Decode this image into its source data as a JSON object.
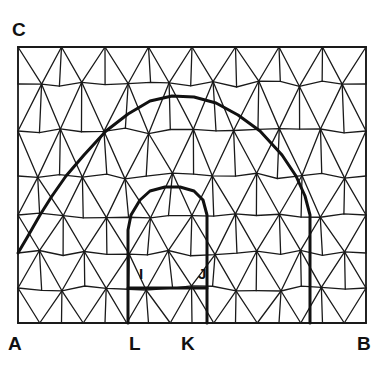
{
  "figure": {
    "type": "mesh-diagram",
    "background_color": "#ffffff",
    "line_color": "#1a1a1a",
    "thin_line_width": 1.3,
    "thick_line_width": 3.0,
    "domain_rect": {
      "x": 18,
      "y": 47,
      "width": 348,
      "height": 276
    }
  },
  "labels": {
    "corner_a": {
      "text": "A",
      "x": 8,
      "y": 334,
      "size": "outer"
    },
    "corner_b": {
      "text": "B",
      "x": 357,
      "y": 334,
      "size": "outer"
    },
    "corner_c": {
      "text": "C",
      "x": 12,
      "y": 20,
      "size": "outer"
    },
    "point_l": {
      "text": "L",
      "x": 129,
      "y": 334,
      "size": "outer"
    },
    "point_k": {
      "text": "K",
      "x": 181,
      "y": 334,
      "size": "outer"
    },
    "point_i": {
      "text": "I",
      "x": 139,
      "y": 266,
      "size": "inner"
    },
    "point_j": {
      "text": "J",
      "x": 198,
      "y": 266,
      "size": "inner"
    }
  },
  "chart_data": {
    "type": "mesh",
    "thin_edges": [
      [
        18,
        47,
        366,
        47
      ],
      [
        18,
        323,
        366,
        323
      ],
      [
        18,
        47,
        18,
        323
      ],
      [
        366,
        47,
        366,
        323
      ],
      [
        18,
        84,
        366,
        84
      ],
      [
        18,
        131,
        366,
        131
      ],
      [
        18,
        176,
        366,
        176
      ],
      [
        18,
        215,
        366,
        215
      ],
      [
        18,
        253,
        366,
        253
      ],
      [
        18,
        288,
        366,
        288
      ],
      [
        18,
        47,
        40,
        84
      ],
      [
        40,
        84,
        62,
        47
      ],
      [
        62,
        47,
        84,
        84
      ],
      [
        84,
        84,
        106,
        47
      ],
      [
        106,
        47,
        128,
        84
      ],
      [
        128,
        84,
        150,
        47
      ],
      [
        150,
        47,
        172,
        84
      ],
      [
        172,
        84,
        194,
        47
      ],
      [
        194,
        47,
        216,
        84
      ],
      [
        216,
        84,
        238,
        47
      ],
      [
        238,
        47,
        260,
        84
      ],
      [
        260,
        84,
        282,
        47
      ],
      [
        282,
        47,
        304,
        84
      ],
      [
        304,
        84,
        326,
        47
      ],
      [
        326,
        47,
        348,
        84
      ],
      [
        348,
        84,
        366,
        47
      ],
      [
        40,
        84,
        62,
        47
      ],
      [
        18,
        84,
        40,
        47
      ],
      [
        40,
        47,
        40,
        84
      ],
      [
        84,
        47,
        84,
        84
      ],
      [
        128,
        47,
        128,
        84
      ],
      [
        172,
        47,
        172,
        84
      ],
      [
        216,
        47,
        216,
        84
      ],
      [
        260,
        47,
        260,
        84
      ],
      [
        304,
        47,
        304,
        84
      ],
      [
        348,
        47,
        348,
        84
      ],
      [
        18,
        84,
        40,
        131
      ],
      [
        40,
        131,
        62,
        84
      ],
      [
        62,
        84,
        84,
        131
      ],
      [
        84,
        131,
        106,
        84
      ],
      [
        106,
        84,
        128,
        131
      ],
      [
        128,
        131,
        150,
        84
      ],
      [
        150,
        84,
        172,
        131
      ],
      [
        172,
        131,
        194,
        84
      ],
      [
        194,
        84,
        216,
        131
      ],
      [
        216,
        131,
        238,
        84
      ],
      [
        238,
        84,
        260,
        131
      ],
      [
        260,
        131,
        282,
        84
      ],
      [
        282,
        84,
        304,
        131
      ],
      [
        304,
        131,
        326,
        84
      ],
      [
        326,
        84,
        348,
        131
      ],
      [
        348,
        131,
        366,
        84
      ],
      [
        62,
        84,
        62,
        131
      ],
      [
        106,
        84,
        106,
        131
      ],
      [
        150,
        84,
        150,
        131
      ],
      [
        194,
        84,
        194,
        131
      ],
      [
        238,
        84,
        238,
        131
      ],
      [
        282,
        84,
        282,
        131
      ],
      [
        326,
        84,
        326,
        131
      ],
      [
        18,
        131,
        40,
        176
      ],
      [
        40,
        176,
        62,
        131
      ],
      [
        62,
        131,
        84,
        176
      ],
      [
        84,
        176,
        106,
        131
      ],
      [
        106,
        131,
        128,
        176
      ],
      [
        128,
        176,
        150,
        131
      ],
      [
        150,
        131,
        172,
        176
      ],
      [
        172,
        176,
        194,
        131
      ],
      [
        194,
        131,
        216,
        176
      ],
      [
        216,
        176,
        238,
        131
      ],
      [
        238,
        131,
        260,
        176
      ],
      [
        260,
        176,
        282,
        131
      ],
      [
        282,
        131,
        304,
        176
      ],
      [
        304,
        176,
        326,
        131
      ],
      [
        326,
        131,
        348,
        176
      ],
      [
        348,
        176,
        366,
        131
      ],
      [
        40,
        131,
        40,
        176
      ],
      [
        84,
        131,
        84,
        176
      ],
      [
        128,
        131,
        128,
        176
      ],
      [
        172,
        131,
        172,
        176
      ],
      [
        216,
        131,
        216,
        176
      ],
      [
        260,
        131,
        260,
        176
      ],
      [
        304,
        131,
        304,
        176
      ],
      [
        348,
        131,
        348,
        176
      ],
      [
        18,
        176,
        40,
        215
      ],
      [
        40,
        215,
        62,
        176
      ],
      [
        62,
        176,
        84,
        215
      ],
      [
        84,
        215,
        106,
        176
      ],
      [
        106,
        176,
        128,
        215
      ],
      [
        128,
        215,
        150,
        176
      ],
      [
        150,
        176,
        172,
        215
      ],
      [
        172,
        215,
        194,
        176
      ],
      [
        194,
        176,
        216,
        215
      ],
      [
        216,
        215,
        238,
        176
      ],
      [
        238,
        176,
        260,
        215
      ],
      [
        260,
        215,
        282,
        176
      ],
      [
        282,
        176,
        304,
        215
      ],
      [
        304,
        215,
        326,
        176
      ],
      [
        326,
        176,
        348,
        215
      ],
      [
        348,
        215,
        366,
        176
      ],
      [
        62,
        176,
        62,
        215
      ],
      [
        106,
        176,
        106,
        215
      ],
      [
        150,
        176,
        150,
        215
      ],
      [
        194,
        176,
        194,
        215
      ],
      [
        238,
        176,
        238,
        215
      ],
      [
        282,
        176,
        282,
        215
      ],
      [
        326,
        176,
        326,
        215
      ],
      [
        18,
        215,
        40,
        253
      ],
      [
        40,
        253,
        62,
        215
      ],
      [
        62,
        215,
        84,
        253
      ],
      [
        84,
        253,
        106,
        215
      ],
      [
        106,
        215,
        128,
        253
      ],
      [
        128,
        253,
        150,
        215
      ],
      [
        150,
        215,
        172,
        253
      ],
      [
        172,
        253,
        194,
        215
      ],
      [
        194,
        215,
        216,
        253
      ],
      [
        216,
        253,
        238,
        215
      ],
      [
        238,
        215,
        260,
        253
      ],
      [
        260,
        253,
        282,
        215
      ],
      [
        282,
        215,
        304,
        253
      ],
      [
        304,
        253,
        326,
        215
      ],
      [
        326,
        215,
        348,
        253
      ],
      [
        348,
        253,
        366,
        215
      ],
      [
        40,
        215,
        40,
        253
      ],
      [
        84,
        215,
        84,
        253
      ],
      [
        128,
        215,
        128,
        253
      ],
      [
        172,
        215,
        172,
        253
      ],
      [
        216,
        215,
        216,
        253
      ],
      [
        260,
        215,
        260,
        253
      ],
      [
        304,
        215,
        304,
        253
      ],
      [
        348,
        215,
        348,
        253
      ],
      [
        18,
        253,
        40,
        288
      ],
      [
        40,
        288,
        62,
        253
      ],
      [
        62,
        253,
        84,
        288
      ],
      [
        84,
        288,
        106,
        253
      ],
      [
        106,
        253,
        128,
        288
      ],
      [
        128,
        288,
        150,
        253
      ],
      [
        150,
        253,
        172,
        288
      ],
      [
        172,
        288,
        194,
        253
      ],
      [
        194,
        253,
        216,
        288
      ],
      [
        216,
        288,
        238,
        253
      ],
      [
        238,
        253,
        260,
        288
      ],
      [
        260,
        288,
        282,
        253
      ],
      [
        282,
        253,
        304,
        288
      ],
      [
        304,
        288,
        326,
        253
      ],
      [
        326,
        253,
        348,
        288
      ],
      [
        348,
        288,
        366,
        253
      ],
      [
        18,
        288,
        40,
        323
      ],
      [
        40,
        323,
        62,
        288
      ],
      [
        62,
        288,
        84,
        323
      ],
      [
        84,
        323,
        106,
        288
      ],
      [
        106,
        288,
        128,
        323
      ],
      [
        128,
        323,
        150,
        288
      ],
      [
        150,
        288,
        172,
        323
      ],
      [
        172,
        323,
        194,
        288
      ],
      [
        194,
        288,
        216,
        323
      ],
      [
        216,
        323,
        238,
        288
      ],
      [
        238,
        288,
        260,
        323
      ],
      [
        260,
        323,
        282,
        288
      ],
      [
        282,
        288,
        304,
        323
      ],
      [
        304,
        323,
        326,
        288
      ],
      [
        326,
        288,
        348,
        323
      ],
      [
        348,
        323,
        366,
        288
      ]
    ],
    "thick_paths": [
      {
        "name": "outer-arch",
        "points": [
          [
            18,
            253
          ],
          [
            28,
            236
          ],
          [
            40,
            215
          ],
          [
            52,
            196
          ],
          [
            66,
            176
          ],
          [
            84,
            155
          ],
          [
            106,
            131
          ],
          [
            128,
            114
          ],
          [
            150,
            101
          ],
          [
            172,
            96
          ],
          [
            194,
            97
          ],
          [
            216,
            103
          ],
          [
            238,
            115
          ],
          [
            260,
            131
          ],
          [
            282,
            155
          ],
          [
            296,
            176
          ],
          [
            305,
            196
          ],
          [
            310,
            215
          ],
          [
            310,
            253
          ],
          [
            310,
            288
          ],
          [
            310,
            323
          ]
        ]
      },
      {
        "name": "inner-arch",
        "points": [
          [
            128,
            323
          ],
          [
            128,
            288
          ],
          [
            128,
            253
          ],
          [
            128,
            230
          ],
          [
            131,
            215
          ],
          [
            140,
            200
          ],
          [
            150,
            191
          ],
          [
            165,
            187
          ],
          [
            180,
            187
          ],
          [
            194,
            191
          ],
          [
            203,
            200
          ],
          [
            207,
            215
          ],
          [
            207,
            253
          ],
          [
            207,
            288
          ],
          [
            207,
            323
          ]
        ]
      },
      {
        "name": "base-segment-LK",
        "points": [
          [
            128,
            288
          ],
          [
            207,
            288
          ]
        ]
      }
    ]
  }
}
